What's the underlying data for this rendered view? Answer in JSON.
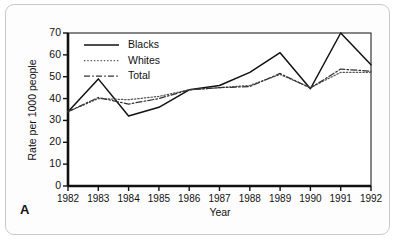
{
  "figure": {
    "panel_label": "A"
  },
  "chart_data": {
    "type": "line",
    "title": "",
    "xlabel": "Year",
    "ylabel": "Rate per 1000 people",
    "categories": [
      "1982",
      "1983",
      "1984",
      "1985",
      "1986",
      "1987",
      "1988",
      "1989",
      "1990",
      "1991",
      "1992"
    ],
    "x": [
      1982,
      1983,
      1984,
      1985,
      1986,
      1987,
      1988,
      1989,
      1990,
      1991,
      1992
    ],
    "xlim": [
      1982,
      1992
    ],
    "ylim": [
      0,
      70
    ],
    "yticks": [
      0,
      10,
      20,
      30,
      40,
      50,
      60,
      70
    ],
    "ytick_labels": [
      "0",
      "10",
      "20",
      "30",
      "40",
      "50",
      "60",
      "70"
    ],
    "grid": false,
    "legend_position": "upper-left",
    "series": [
      {
        "name": "Blacks",
        "style": "solid",
        "color": "#111111",
        "values": [
          34,
          49,
          32,
          36,
          44,
          46,
          52,
          61,
          44.5,
          70,
          55.5
        ]
      },
      {
        "name": "Whites",
        "style": "dotted",
        "color": "#555555",
        "values": [
          34,
          40,
          39.5,
          41,
          44,
          45,
          46,
          51,
          45,
          52,
          52
        ]
      },
      {
        "name": "Total",
        "style": "dash-dot",
        "color": "#333333",
        "values": [
          34,
          40.5,
          37.5,
          40,
          44,
          45,
          45.5,
          51.5,
          44.8,
          53.5,
          52.5
        ]
      }
    ]
  }
}
